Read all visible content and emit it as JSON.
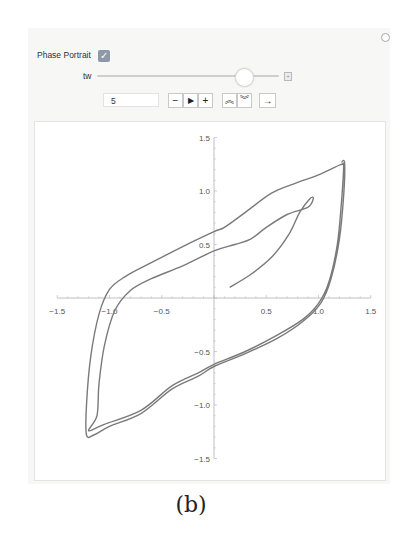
{
  "controls": {
    "phase_portrait_label": "Phase Portrait",
    "phase_portrait_checked": true,
    "checkbox_glyph": "✓",
    "slider_label": "tw",
    "slider_position_fraction": 0.8,
    "value_input": "5",
    "buttons": [
      {
        "name": "step-back-button",
        "glyph": "−"
      },
      {
        "name": "play-button",
        "glyph": "▶"
      },
      {
        "name": "step-forward-button",
        "glyph": "+"
      },
      {
        "name": "faster-button",
        "glyph": "≈"
      },
      {
        "name": "slower-button",
        "glyph": "≋"
      },
      {
        "name": "direction-button",
        "glyph": "→"
      }
    ],
    "options_icon": "gear-icon",
    "slider_expand_icon": "plus-icon"
  },
  "caption": "(b)",
  "chart_data": {
    "type": "line",
    "title": "",
    "xlabel": "",
    "ylabel": "",
    "xlim": [
      -1.5,
      1.5
    ],
    "ylim": [
      -1.5,
      1.5
    ],
    "x_ticks": [
      "-1.5",
      "-1.0",
      "-0.5",
      "0.5",
      "1.0",
      "1.5"
    ],
    "y_ticks": [
      "1.5",
      "1.0",
      "0.5",
      "-0.5",
      "-1.0",
      "-1.5"
    ],
    "grid": false,
    "series": [
      {
        "name": "phase trajectory",
        "color": "#7a7a7a",
        "points": [
          [
            0.15,
            0.1
          ],
          [
            0.35,
            0.22
          ],
          [
            0.55,
            0.38
          ],
          [
            0.72,
            0.6
          ],
          [
            0.82,
            0.8
          ],
          [
            0.92,
            0.93
          ],
          [
            0.95,
            0.93
          ],
          [
            0.9,
            0.85
          ],
          [
            0.7,
            0.78
          ],
          [
            0.5,
            0.66
          ],
          [
            0.35,
            0.55
          ],
          [
            0.2,
            0.5
          ],
          [
            0.0,
            0.44
          ],
          [
            -0.3,
            0.3
          ],
          [
            -0.6,
            0.18
          ],
          [
            -0.8,
            0.07
          ],
          [
            -0.95,
            -0.12
          ],
          [
            -1.05,
            -0.45
          ],
          [
            -1.1,
            -0.8
          ],
          [
            -1.12,
            -1.1
          ],
          [
            -1.2,
            -1.24
          ],
          [
            -1.05,
            -1.18
          ],
          [
            -0.7,
            -1.05
          ],
          [
            -0.4,
            -0.82
          ],
          [
            -0.15,
            -0.7
          ],
          [
            0.0,
            -0.62
          ],
          [
            0.3,
            -0.5
          ],
          [
            0.6,
            -0.35
          ],
          [
            0.85,
            -0.2
          ],
          [
            1.0,
            -0.05
          ],
          [
            1.1,
            0.15
          ],
          [
            1.18,
            0.5
          ],
          [
            1.22,
            0.9
          ],
          [
            1.24,
            1.22
          ],
          [
            1.22,
            1.25
          ],
          [
            1.0,
            1.15
          ],
          [
            0.8,
            1.08
          ],
          [
            0.55,
            0.98
          ],
          [
            0.3,
            0.8
          ],
          [
            0.1,
            0.66
          ],
          [
            0.0,
            0.62
          ],
          [
            -0.3,
            0.48
          ],
          [
            -0.6,
            0.33
          ],
          [
            -0.85,
            0.2
          ],
          [
            -1.0,
            0.08
          ],
          [
            -1.1,
            -0.15
          ],
          [
            -1.18,
            -0.55
          ],
          [
            -1.22,
            -1.0
          ],
          [
            -1.22,
            -1.28
          ],
          [
            -1.15,
            -1.28
          ],
          [
            -1.0,
            -1.2
          ],
          [
            -0.7,
            -1.08
          ],
          [
            -0.4,
            -0.85
          ],
          [
            -0.15,
            -0.73
          ],
          [
            0.0,
            -0.64
          ],
          [
            0.3,
            -0.52
          ],
          [
            0.6,
            -0.38
          ],
          [
            0.85,
            -0.22
          ],
          [
            1.02,
            -0.05
          ],
          [
            1.12,
            0.18
          ],
          [
            1.2,
            0.55
          ],
          [
            1.24,
            0.95
          ],
          [
            1.25,
            1.26
          ],
          [
            1.22,
            1.27
          ]
        ]
      }
    ]
  }
}
